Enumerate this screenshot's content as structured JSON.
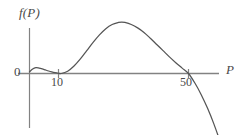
{
  "figure": {
    "background_color": "#ffffff",
    "width": 242,
    "height": 135,
    "axis_color": "#828282",
    "curve_color": "#555555",
    "text_color": "#4a4a4a"
  },
  "labels": {
    "y_axis": "f(P)",
    "x_axis": "P",
    "origin": "0"
  },
  "ticks": {
    "x": [
      {
        "label": "10",
        "value": 10
      },
      {
        "label": "50",
        "value": 50
      }
    ]
  },
  "chart_data": {
    "type": "line",
    "title": "",
    "xlabel": "P",
    "ylabel": "f(P)",
    "grid": false,
    "legend": "none",
    "xtick_labels": [
      "0",
      "10",
      "50"
    ],
    "xtick_values": [
      0,
      10,
      50
    ],
    "ytick_labels": [
      "0"
    ],
    "ytick_values": [
      0
    ],
    "xlim": [
      -1.5,
      61
    ],
    "ylim": [
      -21,
      16
    ],
    "zeros": [
      10,
      50
    ],
    "notes": [
      "Curve starts just above zero at P=0",
      "Small local maximum near P=2",
      "Touches the P-axis tangentially (double root) at P=10",
      "Rises to a global maximum near P=29",
      "Crosses the P-axis downward at P=50",
      "Continues decreasing steeply below the axis"
    ],
    "series": [
      {
        "name": "f(P)",
        "x": [
          0,
          1,
          2,
          3,
          4,
          5,
          6,
          7,
          8,
          9,
          10,
          12,
          14,
          16,
          18,
          20,
          22,
          24,
          26,
          28,
          29,
          30,
          32,
          34,
          36,
          38,
          40,
          42,
          44,
          46,
          48,
          50,
          52,
          54,
          56,
          58,
          60
        ],
        "y": [
          0.4,
          1.1,
          1.4,
          1.3,
          1.1,
          0.85,
          0.6,
          0.38,
          0.2,
          0.06,
          0.0,
          0.55,
          1.8,
          3.5,
          5.5,
          7.5,
          9.3,
          10.8,
          11.8,
          12.3,
          12.4,
          12.3,
          11.8,
          11.0,
          9.9,
          8.5,
          7.0,
          5.5,
          4.0,
          2.6,
          1.3,
          0.0,
          -2.3,
          -5.1,
          -8.4,
          -12.2,
          -16.5
        ]
      }
    ]
  }
}
